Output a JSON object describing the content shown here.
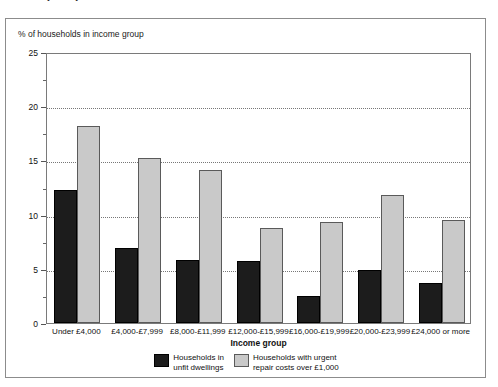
{
  "title": "Ireland (1991)",
  "y_axis_caption": "% of households in income group",
  "x_axis_caption": "Income group",
  "legend": {
    "items": [
      {
        "label": "Households in\nunfit dwellings",
        "color": "#1c1c1c",
        "name": "unfit-dwellings"
      },
      {
        "label": "Households with urgent\nrepair costs over £1,000",
        "color": "#c9c9c9",
        "name": "urgent-repair-costs"
      }
    ]
  },
  "chart_data": {
    "type": "bar",
    "title": "Ireland (1991)",
    "xlabel": "Income group",
    "ylabel": "% of households in income group",
    "ylim": [
      0,
      25
    ],
    "yticks": [
      0,
      5,
      10,
      15,
      20,
      25
    ],
    "ytick_labels": [
      "0",
      "5",
      "10",
      "15",
      "20",
      "25"
    ],
    "yticks_minor": [
      2.5,
      7.5,
      12.5,
      17.5,
      22.5
    ],
    "grid": "horizontal-dotted",
    "legend_position": "bottom-center",
    "categories": [
      "Under £4,000",
      "£4,000-£7,999",
      "£8,000-£11,999",
      "£12,000-£15,999",
      "£16,000-£19,999",
      "£20,000-£23,999",
      "£24,000 or more"
    ],
    "series": [
      {
        "name": "Households in unfit dwellings",
        "color": "#1c1c1c",
        "values": [
          12.3,
          6.9,
          5.8,
          5.7,
          2.5,
          4.9,
          3.7
        ]
      },
      {
        "name": "Households with urgent repair costs over £1,000",
        "color": "#c9c9c9",
        "values": [
          18.2,
          15.2,
          14.1,
          8.8,
          9.3,
          11.8,
          9.5
        ]
      }
    ]
  }
}
